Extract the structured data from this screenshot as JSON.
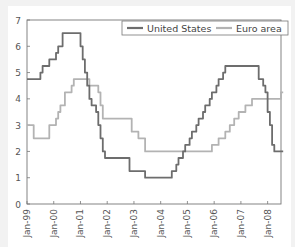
{
  "chart_data": {
    "type": "line",
    "title": "",
    "xlabel": "",
    "ylabel": "",
    "ylim": [
      0,
      7
    ],
    "yticks": [
      0,
      1,
      2,
      3,
      4,
      5,
      6,
      7
    ],
    "xtick_labels": [
      "Jan-99",
      "Jan-00",
      "Jan-01",
      "Jan-02",
      "Jan-03",
      "Jan-04",
      "Jan-05",
      "Jan-06",
      "Jan-07",
      "Jan-08"
    ],
    "grid": false,
    "legend_position": "top-right",
    "x_start": "Jan-99",
    "x_step": "month",
    "series": [
      {
        "name": "United States",
        "color": "#6d6d6d",
        "values": [
          4.75,
          4.75,
          4.75,
          4.75,
          4.75,
          4.75,
          5.0,
          5.25,
          5.25,
          5.25,
          5.5,
          5.5,
          5.5,
          5.75,
          6.0,
          6.0,
          6.5,
          6.5,
          6.5,
          6.5,
          6.5,
          6.5,
          6.5,
          6.5,
          6.0,
          5.5,
          5.0,
          4.5,
          4.0,
          3.75,
          3.75,
          3.5,
          3.0,
          2.5,
          2.0,
          1.75,
          1.75,
          1.75,
          1.75,
          1.75,
          1.75,
          1.75,
          1.75,
          1.75,
          1.75,
          1.75,
          1.25,
          1.25,
          1.25,
          1.25,
          1.25,
          1.25,
          1.25,
          1.0,
          1.0,
          1.0,
          1.0,
          1.0,
          1.0,
          1.0,
          1.0,
          1.0,
          1.0,
          1.0,
          1.0,
          1.25,
          1.25,
          1.5,
          1.75,
          1.75,
          2.0,
          2.25,
          2.25,
          2.5,
          2.75,
          2.75,
          3.0,
          3.25,
          3.25,
          3.5,
          3.75,
          3.75,
          4.0,
          4.25,
          4.25,
          4.5,
          4.75,
          4.75,
          5.0,
          5.25,
          5.25,
          5.25,
          5.25,
          5.25,
          5.25,
          5.25,
          5.25,
          5.25,
          5.25,
          5.25,
          5.25,
          5.25,
          5.25,
          5.25,
          4.75,
          4.75,
          4.5,
          4.25,
          3.5,
          3.0,
          2.25,
          2.0,
          2.0,
          2.0,
          2.0
        ]
      },
      {
        "name": "Euro area",
        "color": "#b3b3b3",
        "values": [
          3.0,
          3.0,
          3.0,
          2.5,
          2.5,
          2.5,
          2.5,
          2.5,
          2.5,
          2.5,
          3.0,
          3.0,
          3.0,
          3.25,
          3.5,
          3.75,
          3.75,
          4.25,
          4.25,
          4.25,
          4.5,
          4.75,
          4.75,
          4.75,
          4.75,
          4.75,
          4.75,
          4.75,
          4.5,
          4.5,
          4.5,
          4.5,
          4.25,
          3.75,
          3.25,
          3.25,
          3.25,
          3.25,
          3.25,
          3.25,
          3.25,
          3.25,
          3.25,
          3.25,
          3.25,
          3.25,
          3.25,
          2.75,
          2.75,
          2.75,
          2.5,
          2.5,
          2.5,
          2.0,
          2.0,
          2.0,
          2.0,
          2.0,
          2.0,
          2.0,
          2.0,
          2.0,
          2.0,
          2.0,
          2.0,
          2.0,
          2.0,
          2.0,
          2.0,
          2.0,
          2.0,
          2.0,
          2.0,
          2.0,
          2.0,
          2.0,
          2.0,
          2.0,
          2.0,
          2.0,
          2.0,
          2.0,
          2.0,
          2.25,
          2.25,
          2.25,
          2.5,
          2.5,
          2.5,
          2.75,
          2.75,
          3.0,
          3.0,
          3.25,
          3.25,
          3.5,
          3.5,
          3.5,
          3.75,
          3.75,
          3.75,
          4.0,
          4.0,
          4.0,
          4.0,
          4.0,
          4.0,
          4.0,
          4.0,
          4.0,
          4.0,
          4.0,
          4.0,
          4.0,
          4.25
        ]
      }
    ]
  },
  "legend": {
    "items": [
      {
        "label": "United States",
        "color": "#6d6d6d"
      },
      {
        "label": "Euro area",
        "color": "#b3b3b3"
      }
    ]
  }
}
